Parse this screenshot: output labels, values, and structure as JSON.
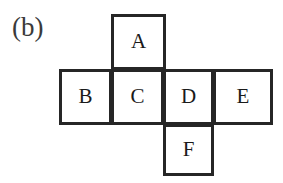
{
  "figure": {
    "panel_label": "(b)",
    "background_color": "#ffffff",
    "line_color": "#262626",
    "text_color": "#1a1a1a"
  },
  "net": {
    "rows": [
      {
        "row_index": 0,
        "cells": [
          {
            "label": "A",
            "column": 1
          }
        ]
      },
      {
        "row_index": 1,
        "cells": [
          {
            "label": "B",
            "column": 0
          },
          {
            "label": "C",
            "column": 1
          },
          {
            "label": "D",
            "column": 2
          },
          {
            "label": "E",
            "column": 3
          }
        ]
      },
      {
        "row_index": 2,
        "cells": [
          {
            "label": "F",
            "column": 2
          }
        ]
      }
    ],
    "faces": {
      "a": "A",
      "b": "B",
      "c": "C",
      "d": "D",
      "e": "E",
      "f": "F"
    }
  },
  "chart_data": {
    "type": "diagram",
    "title": "(b)",
    "subtype": "cube-net",
    "grid_columns": 4,
    "grid_rows": 3,
    "cells": [
      {
        "label": "A",
        "row": 0,
        "col": 1
      },
      {
        "label": "B",
        "row": 1,
        "col": 0
      },
      {
        "label": "C",
        "row": 1,
        "col": 1
      },
      {
        "label": "D",
        "row": 1,
        "col": 2
      },
      {
        "label": "E",
        "row": 1,
        "col": 3
      },
      {
        "label": "F",
        "row": 2,
        "col": 2
      }
    ],
    "xlabel": "",
    "ylabel": "",
    "legend": []
  }
}
